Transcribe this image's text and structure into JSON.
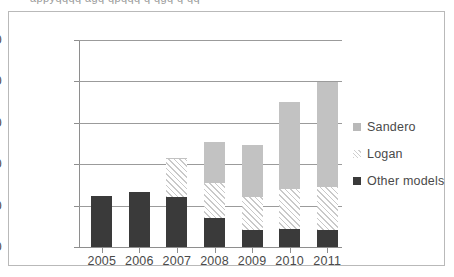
{
  "top_cropped_text": "appyqqqq  agq    qpqqq           q  qgq       q qq",
  "chart_data": {
    "type": "bar",
    "stacked": true,
    "title": "",
    "subtitle": "",
    "xlabel": "",
    "ylabel": "",
    "categories": [
      "2005",
      "2006",
      "2007",
      "2008",
      "2009",
      "2010",
      "2011"
    ],
    "series": [
      {
        "name": "Other models",
        "color": "#3a3a3a",
        "fill": "solid",
        "values": [
          61000,
          66000,
          60000,
          35000,
          21000,
          22000,
          20000
        ]
      },
      {
        "name": "Logan",
        "color": "#c9c9c9",
        "fill": "diagonal-hatch",
        "values": [
          0,
          0,
          46000,
          42000,
          39000,
          48000,
          53000
        ]
      },
      {
        "name": "Sandero",
        "color": "#c2c2c2",
        "fill": "solid",
        "values": [
          0,
          0,
          2000,
          50000,
          63000,
          105000,
          126000
        ]
      }
    ],
    "totals": [
      61000,
      66000,
      108000,
      127000,
      123000,
      175000,
      199000
    ],
    "ylim": [
      0,
      250000
    ],
    "ytick_values": [
      0,
      50000,
      100000,
      150000,
      200000,
      250000
    ],
    "ytick_labels": [
      "0",
      "50 000",
      "100 000",
      "150 000",
      "200 000",
      "250 000"
    ],
    "grid": "horizontal",
    "legend_position": "right",
    "legend_entries": [
      "Sandero",
      "Logan",
      "Other models"
    ]
  }
}
